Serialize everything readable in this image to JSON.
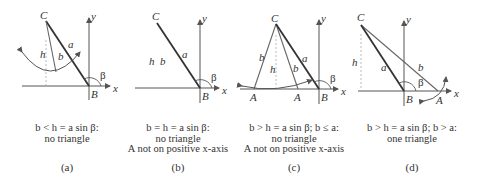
{
  "figure": {
    "panels": [
      {
        "id": "a",
        "label": "(a)",
        "caption": [
          "b < h = a sin β:",
          "no triangle"
        ],
        "points": {
          "C": "C",
          "B": "B"
        },
        "sides": {
          "a": "a",
          "b": "b",
          "h": "h"
        },
        "angle": "β",
        "axes": {
          "x": "x",
          "y": "y"
        }
      },
      {
        "id": "b",
        "label": "(b)",
        "caption": [
          "b = h = a sin β:",
          "no triangle",
          "A not on positive x-axis"
        ],
        "points": {
          "C": "C",
          "B": "B"
        },
        "sides": {
          "a": "a",
          "b": "b",
          "h": "h"
        },
        "angle": "β",
        "axes": {
          "x": "x",
          "y": "y"
        }
      },
      {
        "id": "c",
        "label": "(c)",
        "caption": [
          "b > h = a sin β; b ≤ a:",
          "no triangle",
          "A not on positive x-axis"
        ],
        "points": {
          "C": "C",
          "B": "B",
          "A1": "A",
          "A2": "A"
        },
        "sides": {
          "a": "a",
          "b1": "b",
          "b2": "b",
          "h": "h"
        },
        "angle": "β",
        "axes": {
          "x": "x",
          "y": "y"
        }
      },
      {
        "id": "d",
        "label": "(d)",
        "caption": [
          "b > h = a sin β; b > a:",
          "one triangle"
        ],
        "points": {
          "C": "C",
          "B": "B",
          "A": "A"
        },
        "sides": {
          "a": "a",
          "b": "b",
          "h": "h"
        },
        "angle": "β",
        "axes": {
          "x": "x",
          "y": "y"
        }
      }
    ],
    "colors": {
      "line": "#333333",
      "axis": "#555555",
      "side_b": "#666666",
      "dashed": "#aaaaaa"
    }
  }
}
